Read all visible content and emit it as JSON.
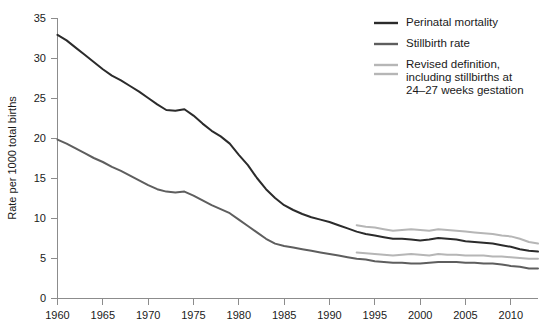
{
  "chart_data": {
    "type": "line",
    "title": "",
    "xlabel": "",
    "ylabel": "Rate per 1000 total births",
    "xlim": [
      1960,
      2013
    ],
    "ylim": [
      0,
      35
    ],
    "grid": false,
    "legend_position": "top-right",
    "xticks": [
      1960,
      1965,
      1970,
      1975,
      1980,
      1985,
      1990,
      1995,
      2000,
      2005,
      2010
    ],
    "yticks": [
      0,
      5,
      10,
      15,
      20,
      25,
      30,
      35
    ],
    "series": [
      {
        "name": "Perinatal mortality",
        "color": "#2b2b2b",
        "x": [
          1960,
          1961,
          1962,
          1963,
          1964,
          1965,
          1966,
          1967,
          1968,
          1969,
          1970,
          1971,
          1972,
          1973,
          1974,
          1975,
          1976,
          1977,
          1978,
          1979,
          1980,
          1981,
          1982,
          1983,
          1984,
          1985,
          1986,
          1987,
          1988,
          1989,
          1990,
          1991,
          1992,
          1993,
          1994,
          1995,
          1996,
          1997,
          1998,
          1999,
          2000,
          2001,
          2002,
          2003,
          2004,
          2005,
          2006,
          2007,
          2008,
          2009,
          2010,
          2011,
          2012,
          2013
        ],
        "values": [
          32.9,
          32.2,
          31.3,
          30.4,
          29.5,
          28.6,
          27.8,
          27.2,
          26.5,
          25.8,
          25.0,
          24.2,
          23.5,
          23.4,
          23.6,
          22.8,
          21.8,
          20.9,
          20.2,
          19.3,
          17.9,
          16.6,
          15.0,
          13.6,
          12.5,
          11.6,
          11.0,
          10.5,
          10.1,
          9.8,
          9.5,
          9.1,
          8.7,
          8.3,
          8.0,
          7.8,
          7.6,
          7.4,
          7.4,
          7.3,
          7.2,
          7.3,
          7.5,
          7.4,
          7.3,
          7.1,
          7.0,
          6.9,
          6.8,
          6.6,
          6.4,
          6.1,
          5.9,
          5.8
        ]
      },
      {
        "name": "Stillbirth rate",
        "color": "#5e5e5e",
        "x": [
          1960,
          1961,
          1962,
          1963,
          1964,
          1965,
          1966,
          1967,
          1968,
          1969,
          1970,
          1971,
          1972,
          1973,
          1974,
          1975,
          1976,
          1977,
          1978,
          1979,
          1980,
          1981,
          1982,
          1983,
          1984,
          1985,
          1986,
          1987,
          1988,
          1989,
          1990,
          1991,
          1992,
          1993,
          1994,
          1995,
          1996,
          1997,
          1998,
          1999,
          2000,
          2001,
          2002,
          2003,
          2004,
          2005,
          2006,
          2007,
          2008,
          2009,
          2010,
          2011,
          2012,
          2013
        ],
        "values": [
          19.8,
          19.3,
          18.7,
          18.1,
          17.5,
          17.0,
          16.4,
          15.9,
          15.3,
          14.7,
          14.1,
          13.6,
          13.3,
          13.2,
          13.3,
          12.8,
          12.2,
          11.6,
          11.1,
          10.6,
          9.8,
          9.0,
          8.2,
          7.4,
          6.8,
          6.5,
          6.3,
          6.1,
          5.9,
          5.7,
          5.5,
          5.3,
          5.1,
          4.9,
          4.8,
          4.6,
          4.5,
          4.4,
          4.4,
          4.3,
          4.3,
          4.4,
          4.5,
          4.5,
          4.5,
          4.4,
          4.4,
          4.3,
          4.3,
          4.2,
          4.0,
          3.9,
          3.7,
          3.7
        ]
      },
      {
        "name": "Revised definition, including stillbirths at 24-27 weeks gestation - perinatal mortality",
        "color": "#b6b6b6",
        "x": [
          1993,
          1994,
          1995,
          1996,
          1997,
          1998,
          1999,
          2000,
          2001,
          2002,
          2003,
          2004,
          2005,
          2006,
          2007,
          2008,
          2009,
          2010,
          2011,
          2012,
          2013
        ],
        "values": [
          9.1,
          8.9,
          8.8,
          8.6,
          8.4,
          8.5,
          8.6,
          8.5,
          8.4,
          8.6,
          8.5,
          8.4,
          8.3,
          8.2,
          8.1,
          8.0,
          7.8,
          7.7,
          7.4,
          7.0,
          6.8
        ]
      },
      {
        "name": "Revised definition, including stillbirths at 24-27 weeks gestation - stillbirth rate",
        "color": "#b6b6b6",
        "x": [
          1993,
          1994,
          1995,
          1996,
          1997,
          1998,
          1999,
          2000,
          2001,
          2002,
          2003,
          2004,
          2005,
          2006,
          2007,
          2008,
          2009,
          2010,
          2011,
          2012,
          2013
        ],
        "values": [
          5.7,
          5.6,
          5.5,
          5.4,
          5.3,
          5.4,
          5.5,
          5.4,
          5.3,
          5.5,
          5.4,
          5.4,
          5.3,
          5.3,
          5.3,
          5.2,
          5.2,
          5.1,
          5.0,
          4.9,
          4.9
        ]
      }
    ],
    "legend": [
      {
        "lines": [
          "Perinatal mortality"
        ],
        "color": "#2b2b2b",
        "double": false
      },
      {
        "lines": [
          "Stillbirth rate"
        ],
        "color": "#5e5e5e",
        "double": false
      },
      {
        "lines": [
          "Revised definition,",
          "including stillbirths at",
          "24–27 weeks gestation"
        ],
        "color": "#b6b6b6",
        "double": true
      }
    ]
  }
}
